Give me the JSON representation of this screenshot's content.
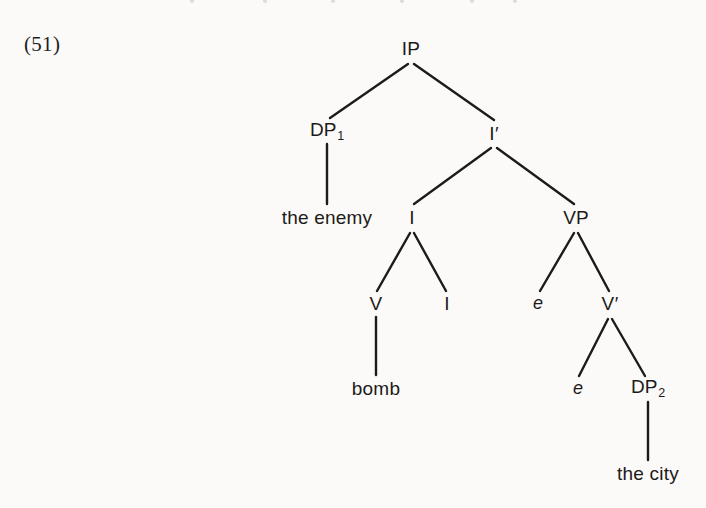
{
  "figure": {
    "example_number": "(51)",
    "background_color": "#fbfaf8",
    "ink_color": "#1d1b19",
    "sentence": "the enemy bomb the city"
  },
  "tree": {
    "nodes": [
      {
        "id": "IP",
        "label": "IP",
        "x": 411,
        "y": 48,
        "kind": "category"
      },
      {
        "id": "DP1",
        "label": "DP",
        "sub": "1",
        "x": 327,
        "y": 131,
        "kind": "category"
      },
      {
        "id": "Ibar",
        "label": "I",
        "prime": "′",
        "x": 494,
        "y": 133,
        "kind": "category"
      },
      {
        "id": "the-enemy",
        "label": "the enemy",
        "x": 327,
        "y": 217,
        "kind": "terminal"
      },
      {
        "id": "I",
        "label": "I",
        "x": 412,
        "y": 217,
        "kind": "category"
      },
      {
        "id": "VP",
        "label": "VP",
        "x": 576,
        "y": 217,
        "kind": "category"
      },
      {
        "id": "V",
        "label": "V",
        "x": 376,
        "y": 303,
        "kind": "category"
      },
      {
        "id": "I-head",
        "label": "I",
        "x": 447,
        "y": 303,
        "kind": "category"
      },
      {
        "id": "e-vp",
        "label": "e",
        "x": 538,
        "y": 303,
        "kind": "trace"
      },
      {
        "id": "Vbar",
        "label": "V",
        "prime": "′",
        "x": 610,
        "y": 303,
        "kind": "category"
      },
      {
        "id": "bomb",
        "label": "bomb",
        "x": 376,
        "y": 388,
        "kind": "terminal"
      },
      {
        "id": "e-vbar",
        "label": "e",
        "x": 578,
        "y": 388,
        "kind": "trace"
      },
      {
        "id": "DP2",
        "label": "DP",
        "sub": "2",
        "x": 648,
        "y": 388,
        "kind": "category"
      },
      {
        "id": "the-city",
        "label": "the city",
        "x": 648,
        "y": 473,
        "kind": "terminal"
      }
    ],
    "edges": [
      {
        "from": "IP",
        "to": "DP1",
        "x1": 408,
        "y1": 64,
        "x2": 330,
        "y2": 118
      },
      {
        "from": "IP",
        "to": "Ibar",
        "x1": 414,
        "y1": 64,
        "x2": 494,
        "y2": 120
      },
      {
        "from": "DP1",
        "to": "the-enemy",
        "x1": 327,
        "y1": 144,
        "x2": 327,
        "y2": 204
      },
      {
        "from": "Ibar",
        "to": "I",
        "x1": 491,
        "y1": 148,
        "x2": 414,
        "y2": 204
      },
      {
        "from": "Ibar",
        "to": "VP",
        "x1": 497,
        "y1": 148,
        "x2": 574,
        "y2": 204
      },
      {
        "from": "I",
        "to": "V",
        "x1": 410,
        "y1": 233,
        "x2": 377,
        "y2": 291
      },
      {
        "from": "I",
        "to": "I-head",
        "x1": 414,
        "y1": 233,
        "x2": 446,
        "y2": 291
      },
      {
        "from": "VP",
        "to": "e-vp",
        "x1": 574,
        "y1": 233,
        "x2": 540,
        "y2": 291
      },
      {
        "from": "VP",
        "to": "Vbar",
        "x1": 578,
        "y1": 233,
        "x2": 609,
        "y2": 291
      },
      {
        "from": "V",
        "to": "bomb",
        "x1": 376,
        "y1": 317,
        "x2": 376,
        "y2": 375
      },
      {
        "from": "Vbar",
        "to": "e-vbar",
        "x1": 608,
        "y1": 319,
        "x2": 579,
        "y2": 376
      },
      {
        "from": "Vbar",
        "to": "DP2",
        "x1": 612,
        "y1": 319,
        "x2": 645,
        "y2": 376
      },
      {
        "from": "DP2",
        "to": "the-city",
        "x1": 648,
        "y1": 402,
        "x2": 648,
        "y2": 460
      }
    ]
  }
}
